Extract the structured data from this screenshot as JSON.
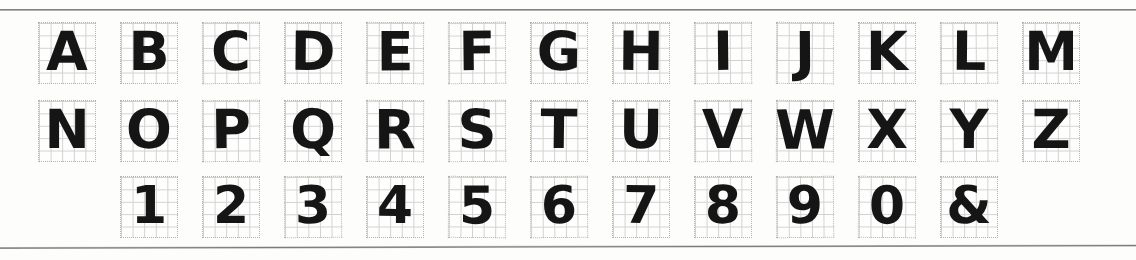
{
  "sheet": {
    "title": "Hand-lettered alphabet and numeral specimen on graph paper",
    "background_color": "#fdfdfc",
    "ink_color": "#151515",
    "grid_line_color": "#cfcfc9",
    "grid_border_color": "#b0b0aa",
    "rule_color": "#6e6e6e",
    "grid_cells_per_box": 5,
    "glyph_box_count": 37
  },
  "rules": {
    "top_label": "top-horizontal-rule",
    "bottom_label": "bottom-horizontal-rule"
  },
  "rows": [
    {
      "name": "letters-row-1",
      "kind": "uppercase-letters",
      "offset_cells": 0,
      "glyphs": [
        "A",
        "B",
        "C",
        "D",
        "E",
        "F",
        "G",
        "H",
        "I",
        "J",
        "K",
        "L",
        "M"
      ]
    },
    {
      "name": "letters-row-2",
      "kind": "uppercase-letters",
      "offset_cells": 0,
      "glyphs": [
        "N",
        "O",
        "P",
        "Q",
        "R",
        "S",
        "T",
        "U",
        "V",
        "W",
        "X",
        "Y",
        "Z"
      ]
    },
    {
      "name": "digits-row",
      "kind": "numerals-and-symbol",
      "offset_cells": 1,
      "glyphs": [
        "1",
        "2",
        "3",
        "4",
        "5",
        "6",
        "7",
        "8",
        "9",
        "0",
        "&"
      ]
    }
  ]
}
